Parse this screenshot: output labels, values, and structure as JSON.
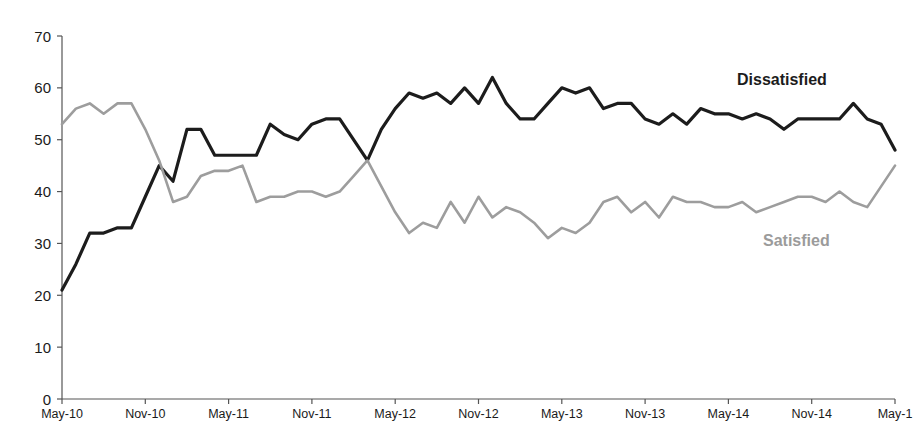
{
  "chart_data": {
    "type": "line",
    "title": "",
    "subtitle": "",
    "xlabel": "",
    "ylabel": "",
    "ylim": [
      0,
      70
    ],
    "ytick_labels": [
      "0",
      "10",
      "20",
      "30",
      "40",
      "50",
      "60",
      "70"
    ],
    "ytick_values": [
      0,
      10,
      20,
      30,
      40,
      50,
      60,
      70
    ],
    "grid": false,
    "legend_position": "inline-right",
    "xtick_labels": [
      "May-10",
      "Nov-10",
      "May-11",
      "Nov-11",
      "May-12",
      "Nov-12",
      "May-13",
      "Nov-13",
      "May-14",
      "Nov-14",
      "May-1"
    ],
    "xtick_index": [
      0,
      6,
      12,
      18,
      24,
      30,
      36,
      42,
      48,
      54,
      60
    ],
    "x_count": 61,
    "series": [
      {
        "name": "Dissatisfied",
        "color": "#1c1c1c",
        "label_text": "Dissatisfied",
        "values": [
          21,
          26,
          32,
          32,
          33,
          33,
          39,
          45,
          42,
          52,
          52,
          47,
          47,
          47,
          47,
          53,
          51,
          50,
          53,
          54,
          54,
          50,
          46,
          52,
          56,
          59,
          58,
          59,
          57,
          60,
          57,
          62,
          57,
          54,
          54,
          57,
          60,
          59,
          60,
          56,
          57,
          57,
          54,
          53,
          55,
          53,
          56,
          55,
          55,
          54,
          55,
          54,
          52,
          54,
          54,
          54,
          54,
          57,
          54,
          53,
          48
        ]
      },
      {
        "name": "Satisfied",
        "color": "#9d9d9d",
        "label_text": "Satisfied",
        "values": [
          53,
          56,
          57,
          55,
          57,
          57,
          52,
          46,
          38,
          39,
          43,
          44,
          44,
          45,
          38,
          39,
          39,
          40,
          40,
          39,
          40,
          43,
          46,
          41,
          36,
          32,
          34,
          33,
          38,
          34,
          39,
          35,
          37,
          36,
          34,
          31,
          33,
          32,
          34,
          38,
          39,
          36,
          38,
          35,
          39,
          38,
          38,
          37,
          37,
          38,
          36,
          37,
          38,
          39,
          39,
          38,
          40,
          38,
          37,
          41,
          45
        ]
      }
    ]
  },
  "labels": {
    "dissatisfied": "Dissatisfied",
    "satisfied": "Satisfied"
  }
}
